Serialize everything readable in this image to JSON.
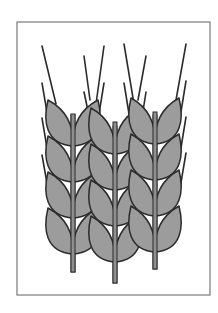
{
  "figure": {
    "colors": {
      "background": "#ffffff",
      "frame": "#7a7a7a",
      "kernel_fill": "#9c9c9c",
      "outline": "#2b2b2b",
      "stem_fill": "#8f8f8f"
    },
    "frame": {
      "x": 17,
      "y": 22,
      "width": 193,
      "height": 273
    },
    "ears": [
      {
        "name": "left-ear",
        "stem": {
          "x": 73,
          "top": 115,
          "bottom": 272
        },
        "kernel_rows": [
          100,
          136,
          172,
          208
        ],
        "kernel_height": 46,
        "kernel_width": 26,
        "awns": [
          {
            "x1": 42,
            "y1": 46,
            "x2": 56,
            "y2": 104
          },
          {
            "x1": 42,
            "y1": 83,
            "x2": 50,
            "y2": 130
          },
          {
            "x1": 42,
            "y1": 118,
            "x2": 50,
            "y2": 166
          },
          {
            "x1": 42,
            "y1": 155,
            "x2": 50,
            "y2": 200
          },
          {
            "x1": 84,
            "y1": 56,
            "x2": 90,
            "y2": 100
          },
          {
            "x1": 84,
            "y1": 92,
            "x2": 92,
            "y2": 130
          }
        ]
      },
      {
        "name": "middle-ear",
        "stem": {
          "x": 115,
          "top": 126,
          "bottom": 283
        },
        "kernel_rows": [
          108,
          144,
          180,
          216
        ],
        "kernel_height": 46,
        "kernel_width": 25,
        "awns": [
          {
            "x1": 104,
            "y1": 46,
            "x2": 96,
            "y2": 104
          },
          {
            "x1": 104,
            "y1": 83,
            "x2": 98,
            "y2": 120
          },
          {
            "x1": 124,
            "y1": 44,
            "x2": 134,
            "y2": 104
          },
          {
            "x1": 124,
            "y1": 83,
            "x2": 130,
            "y2": 120
          }
        ]
      },
      {
        "name": "right-ear",
        "stem": {
          "x": 155,
          "top": 115,
          "bottom": 269
        },
        "kernel_rows": [
          98,
          134,
          170,
          206
        ],
        "kernel_height": 46,
        "kernel_width": 25,
        "awns": [
          {
            "x1": 146,
            "y1": 56,
            "x2": 138,
            "y2": 100
          },
          {
            "x1": 146,
            "y1": 92,
            "x2": 140,
            "y2": 130
          },
          {
            "x1": 186,
            "y1": 44,
            "x2": 176,
            "y2": 100
          },
          {
            "x1": 186,
            "y1": 81,
            "x2": 178,
            "y2": 130
          },
          {
            "x1": 186,
            "y1": 117,
            "x2": 178,
            "y2": 166
          },
          {
            "x1": 186,
            "y1": 153,
            "x2": 178,
            "y2": 200
          }
        ]
      }
    ]
  }
}
